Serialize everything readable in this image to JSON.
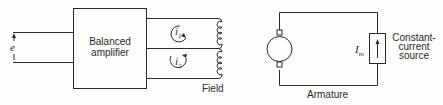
{
  "diagram": {
    "input": {
      "label": "e"
    },
    "amplifier": {
      "line1": "Balanced",
      "line2": "amplifier"
    },
    "field": {
      "label": "Field",
      "currents": [
        {
          "symbol": "i",
          "sub": "1"
        },
        {
          "symbol": "i",
          "sub": "2"
        }
      ]
    },
    "armature": {
      "label": "Armature",
      "current": {
        "symbol": "I",
        "sub": "m"
      },
      "source": {
        "line1": "Constant-",
        "line2": "current",
        "line3": "source"
      }
    },
    "colors": {
      "ink": "#2a2a2a",
      "background": "#fdfdfb"
    }
  }
}
